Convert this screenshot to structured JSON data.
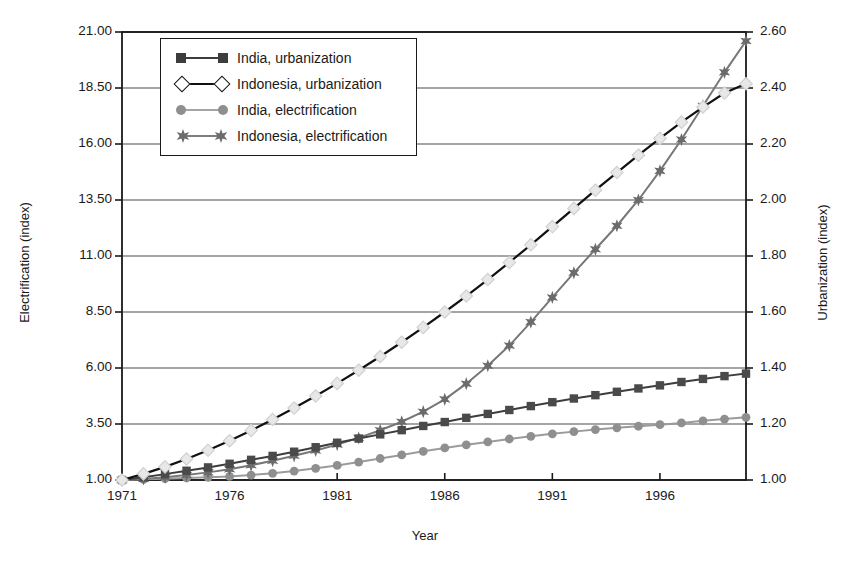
{
  "chart_data": {
    "type": "line",
    "title": "",
    "xlabel": "Year",
    "ylabel": "Electrification (index)",
    "ylabel_right": "Urbanization (index)",
    "grid": true,
    "legend_position": "top-left-inside",
    "xlim": [
      1971,
      2000
    ],
    "xticks": [
      "1971",
      "1976",
      "1981",
      "1986",
      "1991",
      "1996"
    ],
    "xtick_values": [
      1971,
      1976,
      1981,
      1986,
      1991,
      1996
    ],
    "ylim": [
      1.0,
      21.0
    ],
    "yticks": [
      "1.00",
      "3.50",
      "6.00",
      "8.50",
      "11.00",
      "13.50",
      "16.00",
      "18.50",
      "21.00"
    ],
    "ytick_values": [
      1.0,
      3.5,
      6.0,
      8.5,
      11.0,
      13.5,
      16.0,
      18.5,
      21.0
    ],
    "ylim_right": [
      1.0,
      2.6
    ],
    "yticks_right": [
      "1.00",
      "1.20",
      "1.40",
      "1.60",
      "1.80",
      "2.00",
      "2.20",
      "2.40",
      "2.60"
    ],
    "ytick_values_right": [
      1.0,
      1.2,
      1.4,
      1.6,
      1.8,
      2.0,
      2.2,
      2.4,
      2.6
    ],
    "x": [
      1971,
      1972,
      1973,
      1974,
      1975,
      1976,
      1977,
      1978,
      1979,
      1980,
      1981,
      1982,
      1983,
      1984,
      1985,
      1986,
      1987,
      1988,
      1989,
      1990,
      1991,
      1992,
      1993,
      1994,
      1995,
      1996,
      1997,
      1998,
      1999,
      2000
    ],
    "series": [
      {
        "name": "India, urbanization",
        "axis": "right",
        "marker": "square",
        "color": "#3d3d3d",
        "marker_color": "#4a4a4a",
        "values": [
          1.0,
          1.01,
          1.021,
          1.033,
          1.045,
          1.058,
          1.072,
          1.086,
          1.101,
          1.117,
          1.133,
          1.148,
          1.163,
          1.178,
          1.193,
          1.207,
          1.222,
          1.236,
          1.25,
          1.264,
          1.278,
          1.291,
          1.303,
          1.315,
          1.327,
          1.338,
          1.35,
          1.361,
          1.371,
          1.38
        ]
      },
      {
        "name": "Indonesia, urbanization",
        "axis": "right",
        "marker": "diamond-hollow",
        "color": "#111111",
        "marker_color": "#ffffff",
        "values": [
          1.0,
          1.022,
          1.047,
          1.075,
          1.106,
          1.14,
          1.177,
          1.216,
          1.257,
          1.3,
          1.345,
          1.392,
          1.441,
          1.492,
          1.545,
          1.6,
          1.657,
          1.716,
          1.777,
          1.84,
          1.905,
          1.97,
          2.035,
          2.098,
          2.16,
          2.22,
          2.278,
          2.332,
          2.382,
          2.415
        ]
      },
      {
        "name": "India, electrification",
        "axis": "left",
        "marker": "circle",
        "color": "#9b9b9b",
        "marker_color": "#8f8f8f",
        "values": [
          1.0,
          1.03,
          1.06,
          1.09,
          1.12,
          1.16,
          1.22,
          1.3,
          1.4,
          1.52,
          1.65,
          1.8,
          1.96,
          2.12,
          2.28,
          2.43,
          2.57,
          2.7,
          2.83,
          2.95,
          3.06,
          3.16,
          3.25,
          3.33,
          3.4,
          3.47,
          3.55,
          3.64,
          3.72,
          3.8
        ]
      },
      {
        "name": "Indonesia, electrification",
        "axis": "left",
        "marker": "star",
        "color": "#777777",
        "marker_color": "#6b6b6b",
        "values": [
          1.0,
          1.05,
          1.12,
          1.22,
          1.34,
          1.48,
          1.66,
          1.86,
          2.08,
          2.32,
          2.58,
          2.88,
          3.22,
          3.6,
          4.05,
          4.6,
          5.3,
          6.1,
          7.0,
          8.05,
          9.15,
          10.25,
          11.3,
          12.35,
          13.5,
          14.8,
          16.2,
          17.7,
          19.2,
          20.6
        ]
      }
    ]
  },
  "legend": {
    "items": [
      {
        "label": "India, urbanization"
      },
      {
        "label": "Indonesia, urbanization"
      },
      {
        "label": "India, electrification"
      },
      {
        "label": "Indonesia, electrification"
      }
    ]
  },
  "colors": {
    "axis": "#1a1a1a",
    "grid": "#4d4d4d",
    "background": "#ffffff"
  }
}
